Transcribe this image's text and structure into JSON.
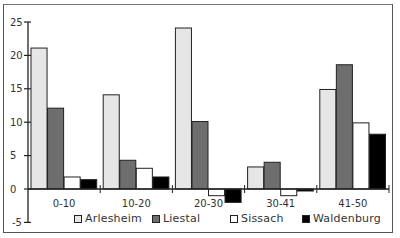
{
  "chart_data": {
    "type": "bar",
    "title": "",
    "xlabel": "",
    "ylabel": "",
    "ylim": [
      -5,
      25
    ],
    "yticks": [
      25,
      20,
      15,
      10,
      5,
      0,
      -5
    ],
    "grid": false,
    "legend_position": "bottom",
    "categories": [
      "0-10",
      "10-20",
      "20-30",
      "30-41",
      "41-50"
    ],
    "series": [
      {
        "name": "Arlesheim",
        "color": "#e6e6e6",
        "values": [
          21.1,
          14.1,
          24.1,
          3.3,
          14.9
        ]
      },
      {
        "name": "Liestal",
        "color": "#6e6e6e",
        "values": [
          12.1,
          4.3,
          10.1,
          4.0,
          18.6
        ]
      },
      {
        "name": "Sissach",
        "color": "#ffffff",
        "values": [
          1.8,
          3.1,
          -1.0,
          -1.0,
          9.9
        ]
      },
      {
        "name": "Waldenburg",
        "color": "#000000",
        "values": [
          1.4,
          1.8,
          -2.0,
          -0.3,
          8.2
        ]
      }
    ]
  },
  "legend": {
    "items": [
      {
        "label": "Arlesheim",
        "color": "#e6e6e6"
      },
      {
        "label": "Liestal",
        "color": "#6e6e6e"
      },
      {
        "label": "Sissach",
        "color": "#ffffff"
      },
      {
        "label": "Waldenburg",
        "color": "#000000"
      }
    ]
  }
}
